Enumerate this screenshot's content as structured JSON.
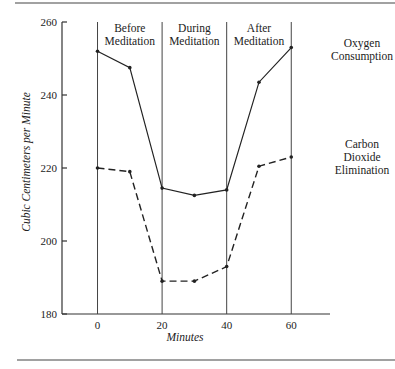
{
  "chart_data": {
    "type": "line",
    "title": "",
    "xlabel": "Minutes",
    "ylabel": "Cubic Centimeters per Minute",
    "xlim": [
      -11,
      72
    ],
    "ylim": [
      180,
      260
    ],
    "x_ticks": [
      0,
      20,
      40,
      60
    ],
    "x_tick_labels": [
      "0",
      "20",
      "40",
      "60"
    ],
    "y_ticks": [
      180,
      200,
      220,
      240,
      260
    ],
    "y_tick_labels": [
      "180",
      "200",
      "220",
      "240",
      "260"
    ],
    "grid": false,
    "phase_boundaries": [
      0,
      20,
      40,
      60
    ],
    "phases": [
      {
        "label_line1": "Before",
        "label_line2": "Meditation",
        "start": 0,
        "end": 20
      },
      {
        "label_line1": "During",
        "label_line2": "Meditation",
        "start": 20,
        "end": 40
      },
      {
        "label_line1": "After",
        "label_line2": "Meditation",
        "start": 40,
        "end": 60
      }
    ],
    "x": [
      0,
      10,
      20,
      30,
      40,
      50,
      60
    ],
    "series": [
      {
        "name": "Oxygen Consumption",
        "label_lines": [
          "Oxygen",
          "Consumption"
        ],
        "style": "solid",
        "values": [
          252,
          247.5,
          214.5,
          212.5,
          214,
          243.5,
          253
        ]
      },
      {
        "name": "Carbon Dioxide Elimination",
        "label_lines": [
          "Carbon",
          "Dioxide",
          "Elimination"
        ],
        "style": "dashed",
        "values": [
          220,
          219,
          189,
          189,
          193,
          220.5,
          223
        ]
      }
    ],
    "legend": "right, inline labels beside line ends",
    "colors": {
      "line": "#222222",
      "background": "#ffffff"
    }
  }
}
